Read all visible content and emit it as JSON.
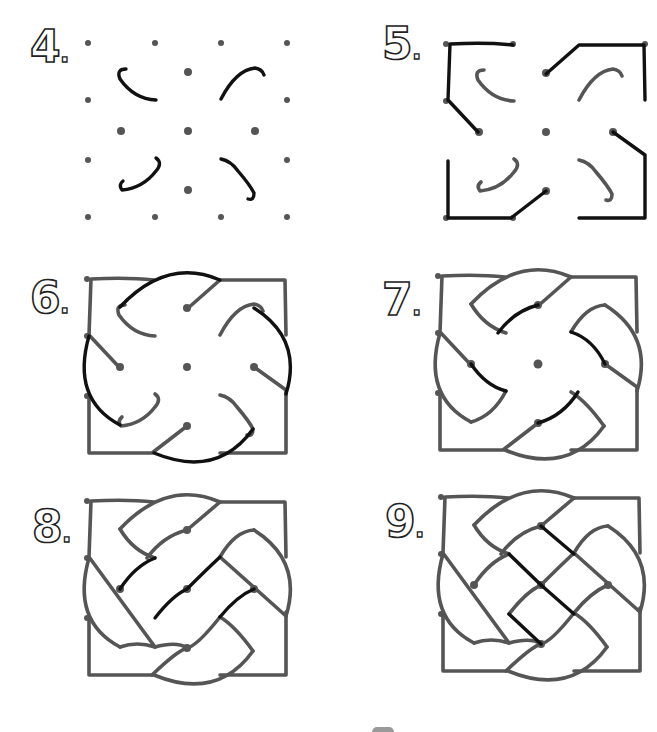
{
  "steps": [
    {
      "number": "4",
      "suffix": ".",
      "description": "Draw four curved hooks around the inner dots"
    },
    {
      "number": "5",
      "suffix": ".",
      "description": "Connect the outer corner dots to form the frame corners"
    },
    {
      "number": "6",
      "suffix": ".",
      "description": "Add the large arcs sweeping around the square"
    },
    {
      "number": "7",
      "suffix": ".",
      "description": "Connect the inner hooks with short strokes"
    },
    {
      "number": "8",
      "suffix": ".",
      "description": "Add diagonal bands through the center"
    },
    {
      "number": "9",
      "suffix": ".",
      "description": "Complete the woven lattice in the opposite diagonal"
    }
  ],
  "colors": {
    "background": "#ffffff",
    "new_stroke": "#111111",
    "previous_stroke": "#555555",
    "dots": "#555555"
  }
}
